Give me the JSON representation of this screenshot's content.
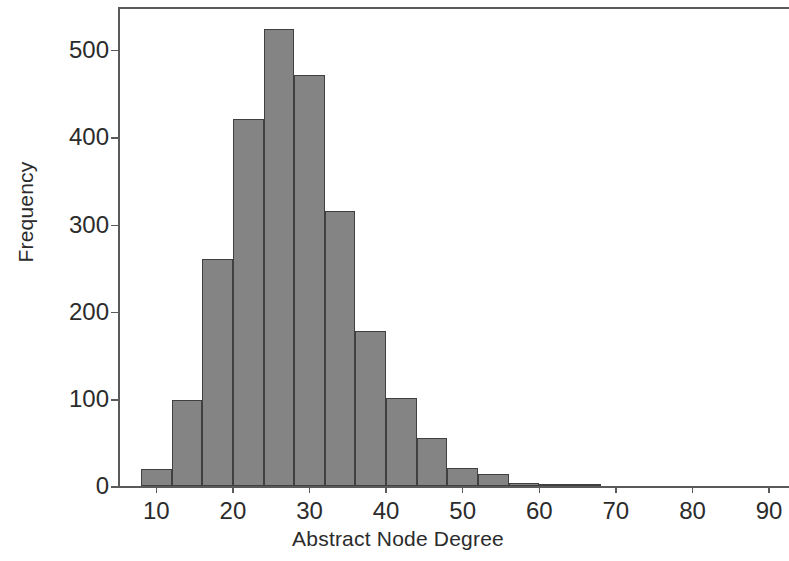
{
  "chart_data": {
    "type": "bar",
    "title": "",
    "subtitle": "",
    "xlabel": "Abstract Node Degree",
    "ylabel": "Frequency",
    "xlim": [
      5.0,
      92.6
    ],
    "ylim": [
      0,
      551
    ],
    "grid": false,
    "legend": null,
    "bar_color": "#848484",
    "bar_edge_color": "#404040",
    "axis_color": "#5a5a5a",
    "text_color": "#2b2b2b",
    "background": "#ffffff",
    "bin_width": 4,
    "xticks": [
      10,
      20,
      30,
      40,
      50,
      60,
      70,
      80,
      90
    ],
    "xtick_labels": [
      "10",
      "20",
      "30",
      "40",
      "50",
      "60",
      "70",
      "80",
      "90"
    ],
    "yticks": [
      0,
      100,
      200,
      300,
      400,
      500
    ],
    "ytick_labels": [
      "0",
      "100",
      "200",
      "300",
      "400",
      "500"
    ],
    "bins": [
      {
        "start": 8,
        "end": 12,
        "center": 10,
        "value": 20
      },
      {
        "start": 12,
        "end": 16,
        "center": 14,
        "value": 99
      },
      {
        "start": 16,
        "end": 20,
        "center": 18,
        "value": 261
      },
      {
        "start": 20,
        "end": 24,
        "center": 22,
        "value": 421
      },
      {
        "start": 24,
        "end": 28,
        "center": 26,
        "value": 524
      },
      {
        "start": 28,
        "end": 32,
        "center": 30,
        "value": 471
      },
      {
        "start": 32,
        "end": 36,
        "center": 34,
        "value": 315
      },
      {
        "start": 36,
        "end": 40,
        "center": 38,
        "value": 178
      },
      {
        "start": 40,
        "end": 44,
        "center": 42,
        "value": 101
      },
      {
        "start": 44,
        "end": 48,
        "center": 46,
        "value": 55
      },
      {
        "start": 48,
        "end": 52,
        "center": 50,
        "value": 21
      },
      {
        "start": 52,
        "end": 56,
        "center": 54,
        "value": 14
      },
      {
        "start": 56,
        "end": 60,
        "center": 58,
        "value": 4
      },
      {
        "start": 60,
        "end": 64,
        "center": 62,
        "value": 3
      },
      {
        "start": 64,
        "end": 68,
        "center": 66,
        "value": 1
      }
    ]
  }
}
